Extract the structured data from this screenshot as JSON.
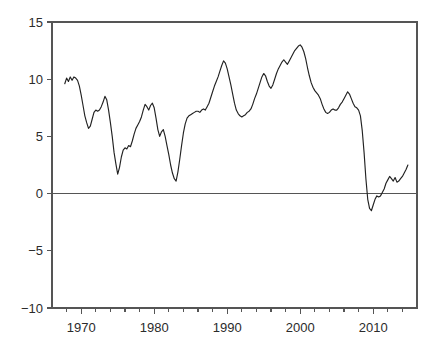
{
  "chart_data": {
    "type": "line",
    "title": "",
    "subtitle": "",
    "xlabel": "",
    "ylabel": "",
    "xlim": [
      1966.0,
      1916.0
    ],
    "ylim": [
      -10,
      15
    ],
    "grid": false,
    "legend": null,
    "legend_position": "none",
    "y_ticks": [
      15,
      10,
      5,
      0,
      -5,
      -10
    ],
    "y_tick_labels": [
      "15",
      "10",
      "5",
      "0",
      "−5",
      "−10"
    ],
    "x_ticks": [
      1970,
      1980,
      1990,
      2000,
      2010
    ],
    "x_tick_labels": [
      "1970",
      "1980",
      "1990",
      "2000",
      "2010"
    ],
    "x_minor_tick_step": 2,
    "x_minor_ticks": [
      1968,
      1972,
      1974,
      1976,
      1978,
      1982,
      1984,
      1986,
      1988,
      1992,
      1994,
      1996,
      1998,
      2002,
      2004,
      2006,
      2008,
      2012,
      2014
    ],
    "series": [
      {
        "name": "series-1",
        "color": "#222222",
        "x": [
          1967.75,
          1968.0,
          1968.25,
          1968.5,
          1968.75,
          1969.0,
          1969.25,
          1969.5,
          1969.75,
          1970.0,
          1970.25,
          1970.5,
          1970.75,
          1971.0,
          1971.25,
          1971.5,
          1971.75,
          1972.0,
          1972.25,
          1972.5,
          1972.75,
          1973.0,
          1973.25,
          1973.5,
          1973.75,
          1974.0,
          1974.25,
          1974.5,
          1974.75,
          1975.0,
          1975.25,
          1975.5,
          1975.75,
          1976.0,
          1976.25,
          1976.5,
          1976.75,
          1977.0,
          1977.25,
          1977.5,
          1977.75,
          1978.0,
          1978.25,
          1978.5,
          1978.75,
          1979.0,
          1979.25,
          1979.5,
          1979.75,
          1980.0,
          1980.25,
          1980.5,
          1980.75,
          1981.0,
          1981.25,
          1981.5,
          1981.75,
          1982.0,
          1982.25,
          1982.5,
          1982.75,
          1983.0,
          1983.25,
          1983.5,
          1983.75,
          1984.0,
          1984.25,
          1984.5,
          1984.75,
          1985.0,
          1985.25,
          1985.5,
          1985.75,
          1986.0,
          1986.25,
          1986.5,
          1986.75,
          1987.0,
          1987.25,
          1987.5,
          1987.75,
          1988.0,
          1988.25,
          1988.5,
          1988.75,
          1989.0,
          1989.25,
          1989.5,
          1989.75,
          1990.0,
          1990.25,
          1990.5,
          1990.75,
          1991.0,
          1991.25,
          1991.5,
          1991.75,
          1992.0,
          1992.25,
          1992.5,
          1992.75,
          1993.0,
          1993.25,
          1993.5,
          1993.75,
          1994.0,
          1994.25,
          1994.5,
          1994.75,
          1995.0,
          1995.25,
          1995.5,
          1995.75,
          1996.0,
          1996.25,
          1996.5,
          1996.75,
          1997.0,
          1997.25,
          1997.5,
          1997.75,
          1998.0,
          1998.25,
          1998.5,
          1998.75,
          1999.0,
          1999.25,
          1999.5,
          1999.75,
          2000.0,
          2000.25,
          2000.5,
          2000.75,
          2001.0,
          2001.25,
          2001.5,
          2001.75,
          2002.0,
          2002.25,
          2002.5,
          2002.75,
          2003.0,
          2003.25,
          2003.5,
          2003.75,
          2004.0,
          2004.25,
          2004.5,
          2004.75,
          2005.0,
          2005.25,
          2005.5,
          2005.75,
          2006.0,
          2006.25,
          2006.5,
          2006.75,
          2007.0,
          2007.25,
          2007.5,
          2007.75,
          2008.0,
          2008.25,
          2008.5,
          2008.75,
          2009.0,
          2009.25,
          2009.5,
          2009.75,
          2010.0,
          2010.25,
          2010.5,
          2010.75,
          2011.0,
          2011.25,
          2011.5,
          2011.75,
          2012.0,
          2012.25,
          2012.5,
          2012.75,
          2013.0,
          2013.25,
          2013.5,
          2013.75,
          2014.0,
          2014.25,
          2014.5,
          2014.75
        ],
        "y": [
          9.6,
          10.1,
          9.8,
          10.2,
          9.9,
          10.2,
          10.1,
          9.9,
          9.4,
          8.6,
          7.7,
          6.8,
          6.2,
          5.7,
          5.9,
          6.5,
          7.1,
          7.3,
          7.2,
          7.3,
          7.6,
          8.0,
          8.5,
          8.2,
          7.3,
          6.2,
          5.0,
          3.6,
          2.6,
          1.7,
          2.3,
          3.2,
          3.8,
          4.0,
          3.9,
          4.2,
          4.1,
          4.6,
          5.2,
          5.7,
          6.0,
          6.3,
          6.7,
          7.3,
          7.8,
          7.6,
          7.3,
          7.7,
          7.9,
          7.5,
          6.6,
          5.6,
          5.0,
          5.4,
          5.6,
          5.0,
          4.2,
          3.4,
          2.5,
          1.8,
          1.3,
          1.1,
          1.9,
          3.0,
          4.2,
          5.3,
          6.1,
          6.6,
          6.8,
          6.9,
          7.0,
          7.1,
          7.2,
          7.2,
          7.1,
          7.3,
          7.4,
          7.3,
          7.6,
          7.9,
          8.4,
          8.9,
          9.4,
          9.8,
          10.2,
          10.7,
          11.2,
          11.6,
          11.4,
          10.9,
          10.2,
          9.5,
          8.7,
          7.9,
          7.3,
          7.0,
          6.8,
          6.7,
          6.8,
          6.9,
          7.1,
          7.2,
          7.4,
          7.8,
          8.3,
          8.7,
          9.2,
          9.7,
          10.2,
          10.5,
          10.3,
          9.8,
          9.4,
          9.2,
          9.5,
          10.0,
          10.5,
          10.9,
          11.2,
          11.5,
          11.7,
          11.5,
          11.3,
          11.6,
          11.9,
          12.2,
          12.5,
          12.7,
          12.9,
          13.0,
          12.8,
          12.4,
          11.8,
          11.0,
          10.3,
          9.7,
          9.3,
          9.0,
          8.8,
          8.6,
          8.3,
          7.8,
          7.4,
          7.1,
          7.0,
          7.1,
          7.3,
          7.4,
          7.3,
          7.3,
          7.5,
          7.8,
          8.0,
          8.3,
          8.6,
          8.9,
          8.7,
          8.3,
          7.9,
          7.6,
          7.5,
          7.3,
          6.8,
          5.5,
          3.6,
          1.3,
          -0.5,
          -1.3,
          -1.5,
          -1.0,
          -0.5,
          -0.2,
          -0.3,
          -0.2,
          0.1,
          0.4,
          0.9,
          1.2,
          1.5,
          1.3,
          1.1,
          1.4,
          1.0,
          1.1,
          1.3,
          1.5,
          1.8,
          2.1,
          2.5
        ]
      }
    ]
  },
  "figure": {
    "background_color": "#ffffff",
    "line_color": "#222222",
    "axis_color": "#555555",
    "text_color": "#2b2b2b"
  }
}
